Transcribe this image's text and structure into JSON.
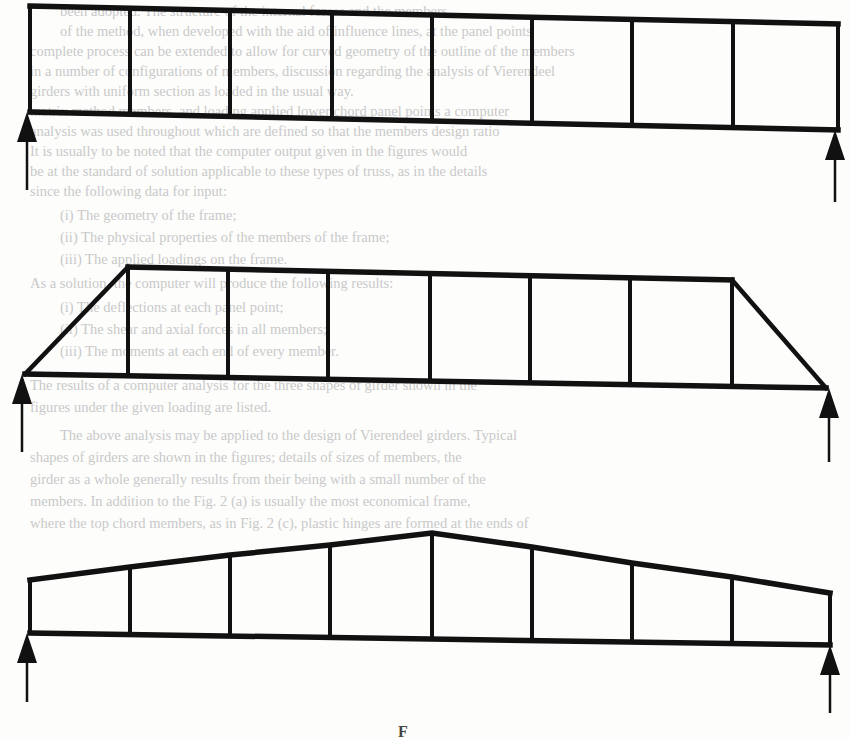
{
  "page": {
    "type": "scanned book page with truss diagrams",
    "background_color": "#fdfdfc",
    "ink_color": "#111111",
    "bleed_text_color": "#c9c9c9"
  },
  "bleed_through_text": [
    {
      "y": 2,
      "x": 60,
      "text": "been adopted. The structure of the internal forces and the members."
    },
    {
      "y": 22,
      "x": 60,
      "text": "of the method, when developed with the aid of influence lines, at the panel points"
    },
    {
      "y": 42,
      "x": 30,
      "text": "complete process can be extended to allow for curved geometry of the outline of the members"
    },
    {
      "y": 62,
      "x": 30,
      "text": "in a number of configurations of members, discussion regarding the analysis of Vierendeel"
    },
    {
      "y": 82,
      "x": 30,
      "text": "girders with uniform section as loaded in the usual way."
    },
    {
      "y": 102,
      "x": 30,
      "text": "matrix method members, and loading applied lower chord panel points a computer"
    },
    {
      "y": 122,
      "x": 30,
      "text": "analysis was used throughout which are defined so that the members design ratio"
    },
    {
      "y": 142,
      "x": 30,
      "text": "It is usually to be noted that the computer output given in the figures would"
    },
    {
      "y": 162,
      "x": 30,
      "text": "be at the standard of solution applicable to these types of truss, as in the details"
    },
    {
      "y": 182,
      "x": 30,
      "text": "since the following data for input:"
    },
    {
      "y": 206,
      "x": 60,
      "text": "(i)  The geometry of the frame;"
    },
    {
      "y": 228,
      "x": 60,
      "text": "(ii)  The physical properties of the members of the frame;"
    },
    {
      "y": 250,
      "x": 60,
      "text": "(iii) The applied loadings on the frame."
    },
    {
      "y": 274,
      "x": 30,
      "text": "As a solution, the computer will produce the following results:"
    },
    {
      "y": 298,
      "x": 60,
      "text": "(i)  The deflections at each panel point;"
    },
    {
      "y": 320,
      "x": 60,
      "text": "(ii)  The shear and axial forces in all members;"
    },
    {
      "y": 342,
      "x": 60,
      "text": "(iii) The moments at each end of every member."
    },
    {
      "y": 376,
      "x": 30,
      "text": "The results of a computer analysis for the three shapes of girder shown in the"
    },
    {
      "y": 398,
      "x": 30,
      "text": "figures under the given loading are listed."
    },
    {
      "y": 426,
      "x": 60,
      "text": "The above analysis may be applied to the design of Vierendeel girders. Typical"
    },
    {
      "y": 448,
      "x": 30,
      "text": "shapes of girders are shown in the figures; details of sizes of members, the"
    },
    {
      "y": 470,
      "x": 30,
      "text": "girder as a whole generally results from their being with a small number of the"
    },
    {
      "y": 492,
      "x": 30,
      "text": "members. In addition to the Fig. 2 (a) is usually the most economical frame,"
    },
    {
      "y": 514,
      "x": 30,
      "text": "where the top chord members, as in Fig. 2 (c), plastic hinges are formed at the ends of"
    }
  ],
  "figure": {
    "label": "F",
    "trusses": [
      {
        "name": "parallel-chord-vierendeel",
        "shape": "rectangular",
        "top_chord": [
          [
            30,
            6
          ],
          [
            838,
            24
          ]
        ],
        "bottom_chord": [
          [
            30,
            112
          ],
          [
            838,
            130
          ]
        ],
        "verticals_x": [
          30,
          130,
          230,
          332,
          432,
          532,
          632,
          733,
          838
        ],
        "panels": 8,
        "supports": [
          {
            "side": "left",
            "x": 27,
            "y_top": 112,
            "y_bottom": 190
          },
          {
            "side": "right",
            "x": 835,
            "y_top": 130,
            "y_bottom": 202
          }
        ]
      },
      {
        "name": "trapezoidal-vierendeel",
        "shape": "trapezoidal with inclined end posts",
        "top_chord": [
          [
            128,
            267
          ],
          [
            732,
            280
          ]
        ],
        "bottom_chord": [
          [
            25,
            374
          ],
          [
            826,
            388
          ]
        ],
        "end_diagonals": [
          [
            [
              25,
              374
            ],
            [
              128,
              267
            ]
          ],
          [
            [
              826,
              388
            ],
            [
              732,
              280
            ]
          ]
        ],
        "verticals_x": [
          128,
          228,
          328,
          430,
          530,
          630,
          732
        ],
        "panels": 8,
        "supports": [
          {
            "side": "left",
            "x": 22,
            "y_top": 374,
            "y_bottom": 452
          },
          {
            "side": "right",
            "x": 829,
            "y_top": 388,
            "y_bottom": 462
          }
        ]
      },
      {
        "name": "peaked-top-vierendeel",
        "shape": "polygonal top chord with central apex",
        "top_chord": [
          [
            30,
            580
          ],
          [
            130,
            567
          ],
          [
            230,
            555
          ],
          [
            330,
            545
          ],
          [
            432,
            533
          ],
          [
            532,
            547
          ],
          [
            632,
            563
          ],
          [
            732,
            577
          ],
          [
            830,
            593
          ]
        ],
        "bottom_chord": [
          [
            30,
            633
          ],
          [
            830,
            645
          ]
        ],
        "verticals_x": [
          30,
          130,
          230,
          330,
          432,
          532,
          632,
          732,
          830
        ],
        "panels": 8,
        "supports": [
          {
            "side": "left",
            "x": 27,
            "y_top": 633,
            "y_bottom": 702
          },
          {
            "side": "right",
            "x": 830,
            "y_top": 645,
            "y_bottom": 713
          }
        ]
      }
    ]
  }
}
